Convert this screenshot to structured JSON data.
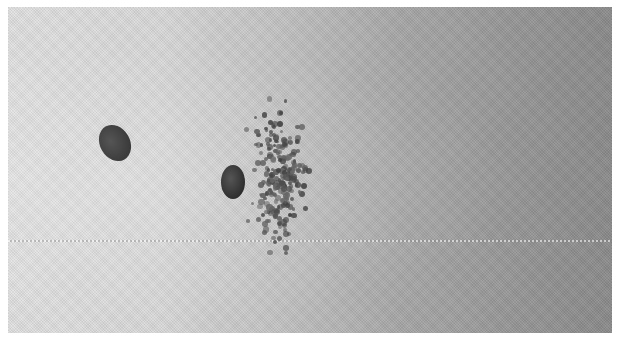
{
  "image": {
    "description": "Grayscale halftone high-speed photograph: one projectile in flight at left, a second projectile bursting through a cloud of scattered particles at center",
    "colors": {
      "page_background": "#ffffff",
      "photo_left": "#e2e2e2",
      "photo_right": "#8c8c8c",
      "projectile": "#3a3a3a",
      "particle": "#555555"
    }
  },
  "scene": {
    "frame": {
      "x": 8,
      "y": 7,
      "width": 604,
      "height": 326
    },
    "scanline_y": 240,
    "projectiles": [
      {
        "name": "projectile-left",
        "cx": 115,
        "cy": 143,
        "rx": 15,
        "ry": 19,
        "rotate": -30,
        "color": "#3b3b3b"
      },
      {
        "name": "projectile-center",
        "cx": 233,
        "cy": 182,
        "rx": 12,
        "ry": 17,
        "rotate": 0,
        "color": "#2f2f2f"
      }
    ],
    "particle_cloud": {
      "cx": 283,
      "cy": 175,
      "spread_x": 34,
      "spread_y": 95,
      "count": 230,
      "min_r": 1.6,
      "max_r": 3.2,
      "seed": 7
    }
  }
}
